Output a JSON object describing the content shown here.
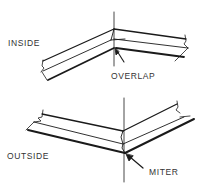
{
  "figure": {
    "panels": [
      {
        "id": "inside",
        "label": "INSIDE",
        "callout": "OVERLAP"
      },
      {
        "id": "outside",
        "label": "OUTSIDE",
        "callout": "MITER"
      }
    ],
    "colors": {
      "ink": "#1a1a1a",
      "background": "#ffffff"
    }
  }
}
